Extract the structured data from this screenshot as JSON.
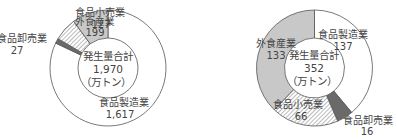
{
  "chart_data": [
    {
      "type": "pie",
      "subtype": "donut",
      "title": "",
      "center_label": {
        "line1": "発生量合計",
        "line2": "1,970",
        "line3": "（万トン）"
      },
      "total": 1970,
      "unit": "万トン",
      "categories": [
        "食品製造業",
        "食品卸売業",
        "食品小売業",
        "外食産業"
      ],
      "values": [
        1617,
        27,
        127,
        199
      ],
      "fills": [
        "#ffffff",
        "#6a6a6a",
        "hatch",
        "#c8c8c8"
      ],
      "start_angle_deg": 0,
      "direction": "clockwise"
    },
    {
      "type": "pie",
      "subtype": "donut",
      "title": "",
      "center_label": {
        "line1": "発生量合計",
        "line2": "352",
        "line3": "（万トン）"
      },
      "total": 352,
      "unit": "万トン",
      "categories": [
        "食品製造業",
        "食品卸売業",
        "食品小売業",
        "外食産業"
      ],
      "values": [
        137,
        16,
        66,
        133
      ],
      "fills": [
        "#ffffff",
        "#6a6a6a",
        "hatch",
        "#c8c8c8"
      ],
      "start_angle_deg": 0,
      "direction": "clockwise"
    }
  ],
  "left": {
    "labels": {
      "manufacturing": {
        "name": "食品製造業",
        "value": "1,617"
      },
      "wholesale": {
        "name": "食品卸売業",
        "value": "27"
      },
      "retail": {
        "name": "食品小売業",
        "value": "127"
      },
      "restaurant": {
        "name": "外食産業",
        "value": "199"
      }
    },
    "center": {
      "line1": "発生量合計",
      "line2": "1,970",
      "line3": "（万トン）"
    }
  },
  "right": {
    "labels": {
      "manufacturing": {
        "name": "食品製造業",
        "value": "137"
      },
      "wholesale": {
        "name": "食品卸売業",
        "value": "16"
      },
      "retail": {
        "name": "食品小売業",
        "value": "66"
      },
      "restaurant": {
        "name": "外食産業",
        "value": "133"
      }
    },
    "center": {
      "line1": "発生量合計",
      "line2": "352",
      "line3": "（万トン）"
    }
  },
  "colors": {
    "outline": "#555555",
    "restaurant_fill": "#c8c8c8",
    "wholesale_fill": "#6a6a6a",
    "hatch_line": "#777777"
  }
}
